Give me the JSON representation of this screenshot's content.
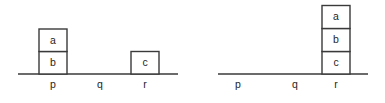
{
  "figure": {
    "name": "blocks-world-states",
    "background_color": "#ffffff",
    "stroke_color": "#3a3a3a",
    "text_color": "#1e1e1e",
    "block_fill": "#ffffff"
  },
  "panels": [
    {
      "id": "initial-state",
      "ground": {
        "x1": 18,
        "x2": 178,
        "y": 74
      },
      "positions": [
        {
          "key": "p",
          "label": "p",
          "x": 53,
          "label_y": 88
        },
        {
          "key": "q",
          "label": "q",
          "x": 100,
          "label_y": 88
        },
        {
          "key": "r",
          "label": "r",
          "x": 145,
          "label_y": 88
        }
      ],
      "blocks": [
        {
          "label": "a",
          "x": 39,
          "y": 29,
          "w": 28,
          "h": 22.5,
          "on": "b",
          "stack": "p"
        },
        {
          "label": "b",
          "x": 39,
          "y": 51.5,
          "w": 28,
          "h": 22.5,
          "on": "p",
          "stack": "p"
        },
        {
          "label": "c",
          "x": 131,
          "y": 51.5,
          "w": 28,
          "h": 22.5,
          "on": "r",
          "stack": "r"
        }
      ]
    },
    {
      "id": "goal-state",
      "ground": {
        "x1": 25,
        "x2": 175,
        "y": 74
      },
      "positions": [
        {
          "key": "p",
          "label": "p",
          "x": 45,
          "label_y": 88
        },
        {
          "key": "q",
          "label": "q",
          "x": 102,
          "label_y": 88
        },
        {
          "key": "r",
          "label": "r",
          "x": 143,
          "label_y": 88
        }
      ],
      "blocks": [
        {
          "label": "a",
          "x": 129,
          "y": 5.5,
          "w": 28,
          "h": 23,
          "on": "b",
          "stack": "r"
        },
        {
          "label": "b",
          "x": 129,
          "y": 28.5,
          "w": 28,
          "h": 23,
          "on": "c",
          "stack": "r"
        },
        {
          "label": "c",
          "x": 129,
          "y": 51.5,
          "w": 28,
          "h": 22.5,
          "on": "r",
          "stack": "r"
        }
      ]
    }
  ]
}
